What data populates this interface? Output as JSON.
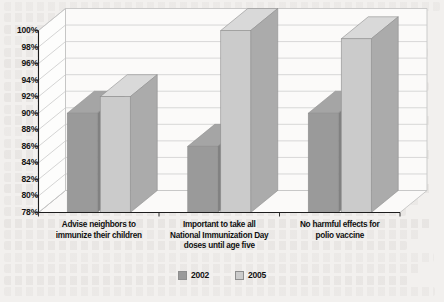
{
  "chart_data": {
    "type": "bar",
    "title": "",
    "subtitle": "",
    "xlabel": "",
    "ylabel": "",
    "ylim": [
      78,
      100
    ],
    "ytick_labels": [
      "100%",
      "98%",
      "96%",
      "94%",
      "92%",
      "90%",
      "88%",
      "86%",
      "84%",
      "82%",
      "80%",
      "78%"
    ],
    "ytick_values": [
      100,
      98,
      96,
      94,
      92,
      90,
      88,
      86,
      84,
      82,
      80,
      78
    ],
    "grid": true,
    "three_d": true,
    "legend_position": "bottom",
    "categories": [
      "Advise neighbors to immunize their children",
      "Important to take all National Immunization Day doses until age five",
      "No harmful effects for polio vaccine"
    ],
    "category_lines": [
      [
        "Advise neighbors to",
        "immunize their children"
      ],
      [
        "Important to take all",
        "National Immunization Day",
        "doses until age five"
      ],
      [
        "No harmful effects for",
        "polio vaccine"
      ]
    ],
    "series": [
      {
        "name": "2002",
        "color": "#9a9a9a",
        "values": [
          90,
          86,
          90
        ]
      },
      {
        "name": "2005",
        "color": "#cbcbcb",
        "values": [
          92,
          100,
          99
        ]
      }
    ]
  },
  "legend": {
    "items": [
      {
        "label": "2002",
        "color": "#9a9a9a"
      },
      {
        "label": "2005",
        "color": "#cbcbcb"
      }
    ]
  }
}
